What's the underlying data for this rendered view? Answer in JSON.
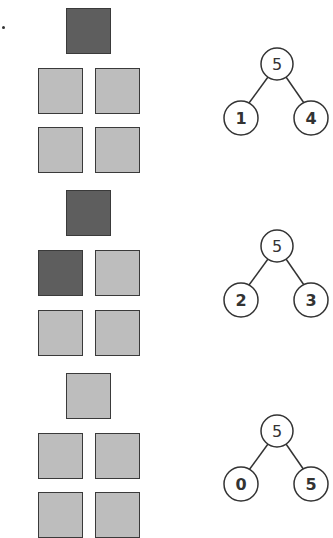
{
  "colors": {
    "shaded": "#5e5e5e",
    "unshaded": "#bdbdbd",
    "border": "#3a3a3a",
    "line": "#333333"
  },
  "problems": [
    {
      "squares": [
        "shaded",
        "unshaded",
        "unshaded",
        "unshaded",
        "unshaded"
      ],
      "bond": {
        "whole": "5",
        "left": "1",
        "right": "4"
      }
    },
    {
      "squares": [
        "shaded",
        "shaded",
        "unshaded",
        "unshaded",
        "unshaded"
      ],
      "bond": {
        "whole": "5",
        "left": "2",
        "right": "3"
      }
    },
    {
      "squares": [
        "unshaded",
        "unshaded",
        "unshaded",
        "unshaded",
        "unshaded"
      ],
      "bond": {
        "whole": "5",
        "left": "0",
        "right": "5"
      }
    }
  ]
}
